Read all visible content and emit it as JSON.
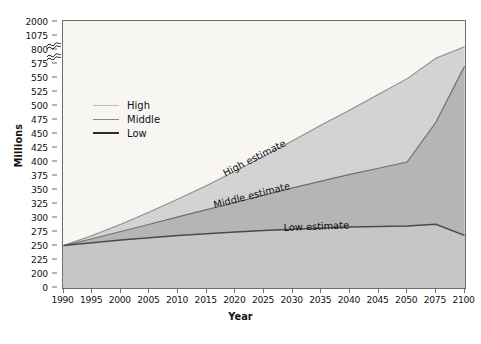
{
  "chart_data": {
    "type": "area",
    "title": "",
    "xlabel": "Year",
    "ylabel": "Millions",
    "grid": false,
    "legend_position": "inside-upper-left",
    "axis_break": true,
    "axis_break_note": "y-axis compressed between 575 and 800 and between 800 and 1075",
    "categories": [
      1990,
      1995,
      2000,
      2005,
      2010,
      2015,
      2020,
      2025,
      2030,
      2035,
      2040,
      2045,
      2050,
      2075,
      2100
    ],
    "x_tick_labels": [
      "1990",
      "1995",
      "2000",
      "2005",
      "2010",
      "2015",
      "2020",
      "2025",
      "2030",
      "2035",
      "2040",
      "2045",
      "2050",
      "2075",
      "2100"
    ],
    "y_tick_labels": [
      "0",
      "200",
      "225",
      "250",
      "275",
      "300",
      "325",
      "350",
      "375",
      "400",
      "425",
      "450",
      "475",
      "500",
      "525",
      "550",
      "575",
      "800",
      "1075",
      "2000"
    ],
    "y_tick_values": [
      0,
      200,
      225,
      250,
      275,
      300,
      325,
      350,
      375,
      400,
      425,
      450,
      475,
      500,
      525,
      550,
      575,
      800,
      1075,
      2000
    ],
    "ylim": [
      0,
      2000
    ],
    "series": [
      {
        "name": "High",
        "label": "High estimate",
        "color": "#d3d3d3",
        "line_color": "#8f8f8f",
        "values": [
          250,
          268,
          288,
          310,
          333,
          357,
          383,
          410,
          437,
          465,
          492,
          520,
          548,
          660,
          853
        ]
      },
      {
        "name": "Middle",
        "label": "Middle estimate",
        "color": "#b5b5b5",
        "line_color": "#6f6f6f",
        "values": [
          250,
          262,
          275,
          288,
          301,
          314,
          327,
          340,
          353,
          365,
          377,
          388,
          399,
          470,
          570
        ]
      },
      {
        "name": "Low",
        "label": "Low estimate",
        "color": "#c6c6c6",
        "line_color": "#4a4a4a",
        "values": [
          250,
          255,
          260,
          264,
          268,
          271,
          274,
          277,
          279,
          281,
          283,
          284,
          285,
          288,
          268
        ]
      }
    ],
    "annotations": [
      {
        "text": "High estimate",
        "x": 2023,
        "y": 382
      },
      {
        "text": "Middle estimate",
        "x": 2020,
        "y": 318
      },
      {
        "text": "Low estimate",
        "x": 2032,
        "y": 263
      }
    ]
  },
  "legend": {
    "items": [
      {
        "label": "High",
        "color": "#bdbdbd",
        "width": 1.6
      },
      {
        "label": "Middle",
        "color": "#878787",
        "width": 1.8
      },
      {
        "label": "Low",
        "color": "#2e2e2e",
        "width": 2.2
      }
    ]
  },
  "axes": {
    "xlabel": "Year",
    "ylabel": "Millions"
  },
  "colors": {
    "frame": "#6d6d6d",
    "plot_background": "#f7f6f3",
    "page_background": "#ffffff",
    "text": "#101010"
  }
}
